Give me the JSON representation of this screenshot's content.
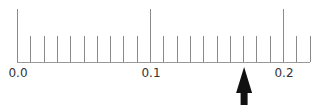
{
  "ruler": {
    "min": 0.0,
    "max": 0.22,
    "major_step": 0.1,
    "minor_step": 0.01,
    "origin_px": 17,
    "px_per_unit": 1330,
    "baseline_y": 62,
    "major_top_y": 9,
    "minor_top_y": 36,
    "end_px": 310,
    "labels": [
      {
        "value": 0.0,
        "text": "0.0"
      },
      {
        "value": 0.1,
        "text": "0.1"
      },
      {
        "value": 0.2,
        "text": "0.2"
      }
    ],
    "tick_color": "#8a8a8a"
  },
  "pointer": {
    "icon": "up-arrow-icon",
    "value": 0.17,
    "color": "#111111"
  }
}
